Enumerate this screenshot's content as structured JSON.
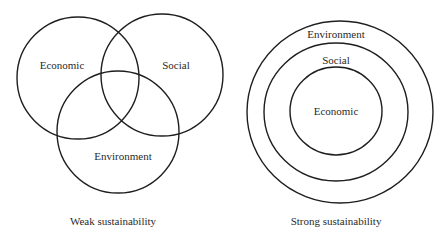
{
  "weak": {
    "caption": "Weak sustainability",
    "circles": {
      "economic": "Economic",
      "social": "Social",
      "environment": "Environment"
    }
  },
  "strong": {
    "caption": "Strong sustainability",
    "rings": {
      "outer": "Environment",
      "middle": "Social",
      "inner": "Economic"
    }
  },
  "colors": {
    "stroke": "#1e1e1e",
    "text": "#2a2a2a",
    "background": "#ffffff"
  }
}
